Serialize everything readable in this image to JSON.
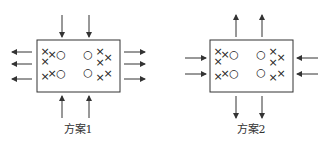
{
  "diagrams": [
    {
      "label": "方案1",
      "box": {
        "x": 37,
        "y": 40,
        "w": 83,
        "h": 52
      },
      "symbols": [
        {
          "t": "×",
          "x": 45,
          "y": 55
        },
        {
          "t": "×",
          "x": 52,
          "y": 58
        },
        {
          "t": "○",
          "x": 61,
          "y": 58
        },
        {
          "t": "×",
          "x": 45,
          "y": 65
        },
        {
          "t": "×",
          "x": 45,
          "y": 80
        },
        {
          "t": "×",
          "x": 52,
          "y": 77
        },
        {
          "t": "○",
          "x": 61,
          "y": 77
        },
        {
          "t": "○",
          "x": 88,
          "y": 58
        },
        {
          "t": "×",
          "x": 100,
          "y": 55
        },
        {
          "t": "×",
          "x": 108,
          "y": 61
        },
        {
          "t": "×",
          "x": 100,
          "y": 66
        },
        {
          "t": "○",
          "x": 88,
          "y": 76
        },
        {
          "t": "×",
          "x": 100,
          "y": 81
        },
        {
          "t": "×",
          "x": 108,
          "y": 77
        }
      ],
      "arrows": [
        {
          "x1": 62,
          "y1": 15,
          "x2": 62,
          "y2": 37
        },
        {
          "x1": 89,
          "y1": 15,
          "x2": 89,
          "y2": 37
        },
        {
          "x1": 62,
          "y1": 118,
          "x2": 62,
          "y2": 96
        },
        {
          "x1": 89,
          "y1": 118,
          "x2": 89,
          "y2": 96
        },
        {
          "x1": 32,
          "y1": 52,
          "x2": 12,
          "y2": 52
        },
        {
          "x1": 32,
          "y1": 64,
          "x2": 12,
          "y2": 64
        },
        {
          "x1": 32,
          "y1": 79,
          "x2": 12,
          "y2": 79
        },
        {
          "x1": 124,
          "y1": 52,
          "x2": 145,
          "y2": 52
        },
        {
          "x1": 124,
          "y1": 64,
          "x2": 145,
          "y2": 64
        },
        {
          "x1": 124,
          "y1": 79,
          "x2": 145,
          "y2": 79
        }
      ],
      "label_pos": {
        "x": 78,
        "y": 133
      }
    },
    {
      "label": "方案2",
      "box": {
        "x": 210,
        "y": 40,
        "w": 83,
        "h": 52
      },
      "symbols": [
        {
          "t": "×",
          "x": 218,
          "y": 55
        },
        {
          "t": "×",
          "x": 225,
          "y": 58
        },
        {
          "t": "○",
          "x": 234,
          "y": 58
        },
        {
          "t": "×",
          "x": 218,
          "y": 65
        },
        {
          "t": "×",
          "x": 218,
          "y": 80
        },
        {
          "t": "×",
          "x": 225,
          "y": 77
        },
        {
          "t": "○",
          "x": 234,
          "y": 77
        },
        {
          "t": "○",
          "x": 261,
          "y": 58
        },
        {
          "t": "×",
          "x": 273,
          "y": 55
        },
        {
          "t": "×",
          "x": 281,
          "y": 61
        },
        {
          "t": "×",
          "x": 273,
          "y": 66
        },
        {
          "t": "○",
          "x": 261,
          "y": 76
        },
        {
          "t": "×",
          "x": 273,
          "y": 81
        },
        {
          "t": "×",
          "x": 281,
          "y": 77
        }
      ],
      "arrows": [
        {
          "x1": 236,
          "y1": 37,
          "x2": 236,
          "y2": 15
        },
        {
          "x1": 262,
          "y1": 37,
          "x2": 262,
          "y2": 15
        },
        {
          "x1": 236,
          "y1": 96,
          "x2": 236,
          "y2": 118
        },
        {
          "x1": 262,
          "y1": 96,
          "x2": 262,
          "y2": 118
        },
        {
          "x1": 185,
          "y1": 58,
          "x2": 206,
          "y2": 58
        },
        {
          "x1": 185,
          "y1": 74,
          "x2": 206,
          "y2": 74
        },
        {
          "x1": 318,
          "y1": 58,
          "x2": 297,
          "y2": 58
        },
        {
          "x1": 318,
          "y1": 74,
          "x2": 297,
          "y2": 74
        }
      ],
      "label_pos": {
        "x": 251,
        "y": 133
      }
    }
  ],
  "colors": {
    "stroke": "#333333",
    "text": "#333333"
  }
}
